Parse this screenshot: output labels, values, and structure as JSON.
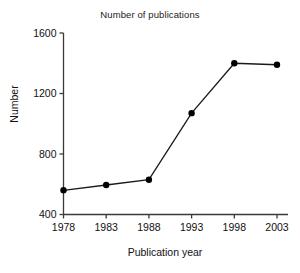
{
  "chart_data": {
    "type": "line",
    "title": "Number of publications",
    "xlabel": "Publication year",
    "ylabel": "Number",
    "categories": [
      1978,
      1983,
      1988,
      1993,
      1998,
      2003
    ],
    "x_tick_labels": [
      "1978",
      "1983",
      "1988",
      "1993",
      "1998",
      "2003"
    ],
    "values": [
      560,
      595,
      630,
      1070,
      1400,
      1390
    ],
    "y_tick_labels": [
      "400",
      "800",
      "1200",
      "1600"
    ],
    "y_ticks": [
      400,
      800,
      1200,
      1600
    ],
    "ylim": [
      400,
      1600
    ],
    "xlim": [
      1976,
      2005
    ],
    "grid": false,
    "legend": false,
    "marker": "filled-circle",
    "line_color": "#1a1a1a",
    "marker_color": "#000000",
    "axis_color": "#3a3a3a",
    "background": "#ffffff"
  }
}
